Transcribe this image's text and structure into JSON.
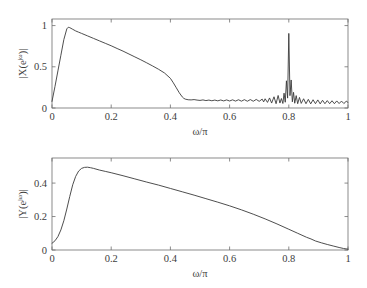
{
  "figure": {
    "background": "#ffffff",
    "curve_color": "#3a3a3a",
    "axis_color": "#6e6e6e",
    "width": 367,
    "height": 288
  },
  "chart_data": [
    {
      "id": "top",
      "type": "line",
      "title": "",
      "xlabel": "ω/π",
      "ylabel": "|X(e^{jω})|",
      "ylabel_parts": {
        "pre": "|X(e",
        "sup": "jω",
        "post": ")|"
      },
      "xlim": [
        0,
        1
      ],
      "ylim": [
        0,
        1.08
      ],
      "xticks": [
        0,
        0.2,
        0.4,
        0.6,
        0.8,
        1
      ],
      "xticklabels": [
        "0",
        "0.2",
        "0.4",
        "0.6",
        "0.8",
        "1"
      ],
      "yticks": [
        0,
        0.5,
        1
      ],
      "yticklabels": [
        "0",
        "0.5",
        "1"
      ],
      "grid": false,
      "legend": null,
      "annotations": [],
      "x": [
        0.0,
        0.01,
        0.02,
        0.03,
        0.04,
        0.05,
        0.055,
        0.06,
        0.07,
        0.08,
        0.09,
        0.1,
        0.12,
        0.14,
        0.16,
        0.18,
        0.2,
        0.22,
        0.24,
        0.26,
        0.28,
        0.3,
        0.32,
        0.34,
        0.36,
        0.38,
        0.4,
        0.41,
        0.42,
        0.43,
        0.44,
        0.445,
        0.45,
        0.46,
        0.47,
        0.48,
        0.49,
        0.5,
        0.51,
        0.52,
        0.53,
        0.54,
        0.55,
        0.56,
        0.57,
        0.58,
        0.59,
        0.6,
        0.61,
        0.62,
        0.63,
        0.64,
        0.65,
        0.66,
        0.67,
        0.68,
        0.69,
        0.7,
        0.71,
        0.715,
        0.72,
        0.728,
        0.735,
        0.742,
        0.75,
        0.757,
        0.764,
        0.77,
        0.775,
        0.78,
        0.784,
        0.788,
        0.792,
        0.796,
        0.8,
        0.804,
        0.808,
        0.812,
        0.816,
        0.82,
        0.825,
        0.83,
        0.836,
        0.842,
        0.85,
        0.858,
        0.866,
        0.874,
        0.882,
        0.89,
        0.898,
        0.906,
        0.914,
        0.922,
        0.93,
        0.938,
        0.946,
        0.954,
        0.962,
        0.97,
        0.978,
        0.986,
        0.994,
        1.0
      ],
      "y": [
        0.08,
        0.26,
        0.45,
        0.64,
        0.83,
        0.96,
        0.98,
        0.975,
        0.955,
        0.935,
        0.92,
        0.905,
        0.875,
        0.845,
        0.815,
        0.785,
        0.755,
        0.722,
        0.69,
        0.655,
        0.62,
        0.585,
        0.548,
        0.51,
        0.47,
        0.425,
        0.36,
        0.305,
        0.245,
        0.185,
        0.135,
        0.118,
        0.108,
        0.1,
        0.098,
        0.102,
        0.096,
        0.092,
        0.098,
        0.09,
        0.096,
        0.088,
        0.096,
        0.087,
        0.097,
        0.086,
        0.098,
        0.085,
        0.099,
        0.084,
        0.1,
        0.083,
        0.101,
        0.082,
        0.102,
        0.082,
        0.104,
        0.081,
        0.108,
        0.074,
        0.112,
        0.068,
        0.122,
        0.06,
        0.136,
        0.052,
        0.152,
        0.06,
        0.115,
        0.055,
        0.18,
        0.07,
        0.33,
        0.12,
        0.905,
        0.15,
        0.34,
        0.075,
        0.19,
        0.058,
        0.15,
        0.052,
        0.128,
        0.056,
        0.112,
        0.052,
        0.105,
        0.05,
        0.1,
        0.052,
        0.098,
        0.05,
        0.094,
        0.052,
        0.09,
        0.052,
        0.088,
        0.052,
        0.086,
        0.054,
        0.084,
        0.054,
        0.082,
        0.068
      ]
    },
    {
      "id": "bottom",
      "type": "line",
      "title": "",
      "xlabel": "ω/π",
      "ylabel": "|Y(e^{jω})|",
      "ylabel_parts": {
        "pre": "|Y(e",
        "sup": "jω",
        "post": ")|"
      },
      "xlim": [
        0,
        1
      ],
      "ylim": [
        0,
        0.55
      ],
      "xticks": [
        0,
        0.2,
        0.4,
        0.6,
        0.8,
        1
      ],
      "xticklabels": [
        "0",
        "0.2",
        "0.4",
        "0.6",
        "0.8",
        "1"
      ],
      "yticks": [
        0,
        0.2,
        0.4
      ],
      "yticklabels": [
        "0",
        "0.2",
        "0.4"
      ],
      "grid": false,
      "legend": null,
      "annotations": [],
      "x": [
        0.0,
        0.01,
        0.02,
        0.03,
        0.04,
        0.05,
        0.06,
        0.07,
        0.08,
        0.09,
        0.1,
        0.11,
        0.12,
        0.13,
        0.14,
        0.16,
        0.18,
        0.2,
        0.24,
        0.28,
        0.32,
        0.36,
        0.4,
        0.44,
        0.48,
        0.52,
        0.56,
        0.6,
        0.64,
        0.68,
        0.72,
        0.76,
        0.8,
        0.83,
        0.86,
        0.875,
        0.89,
        0.91,
        0.93,
        0.95,
        0.97,
        0.985,
        1.0
      ],
      "y": [
        0.04,
        0.055,
        0.08,
        0.12,
        0.175,
        0.245,
        0.32,
        0.39,
        0.44,
        0.472,
        0.488,
        0.494,
        0.495,
        0.492,
        0.488,
        0.478,
        0.47,
        0.462,
        0.444,
        0.425,
        0.406,
        0.388,
        0.368,
        0.348,
        0.328,
        0.307,
        0.286,
        0.264,
        0.24,
        0.214,
        0.186,
        0.156,
        0.124,
        0.1,
        0.076,
        0.066,
        0.054,
        0.043,
        0.033,
        0.024,
        0.015,
        0.009,
        0.005
      ]
    }
  ]
}
